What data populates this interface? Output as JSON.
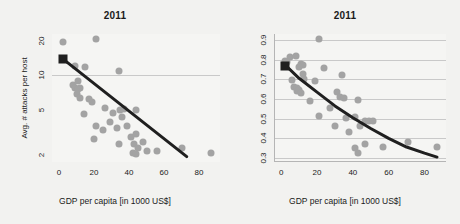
{
  "figure": {
    "background": "#f2f2f0",
    "point_color": "#a3a3a3",
    "fit_color": "#1f1f1f",
    "grid_color": "#c9c9c9"
  },
  "chart_data": [
    {
      "type": "scatter",
      "panel": "left",
      "title": "2011",
      "xlabel": "GDP per capita [in 1000 US$]",
      "ylabel": "Avg. # attacks per host",
      "xlim": [
        -4,
        92
      ],
      "ylim": [
        1.75,
        23
      ],
      "yscale": "log",
      "xticks": [
        0,
        20,
        40,
        60,
        80
      ],
      "xticklabels": [
        "0",
        "20",
        "40",
        "60",
        "80"
      ],
      "yticks": [
        2,
        5,
        10,
        20
      ],
      "yticklabels": [
        "2",
        "5",
        "10",
        "20"
      ],
      "grid": "horizontal-at-10",
      "gridlines_y": [
        10
      ],
      "legend": "none",
      "fit": {
        "kind": "line",
        "marker": {
          "x": 2,
          "y": 14.0,
          "shape": "square",
          "color": "#1f1f1f"
        },
        "points": [
          [
            2,
            14.0
          ],
          [
            73,
            1.95
          ]
        ]
      },
      "points": [
        [
          2,
          19.5
        ],
        [
          21,
          21.0
        ],
        [
          9,
          12.0
        ],
        [
          2,
          14.0
        ],
        [
          15,
          11.8
        ],
        [
          34,
          11.0
        ],
        [
          8,
          8.3
        ],
        [
          9,
          7.7
        ],
        [
          12,
          7.8
        ],
        [
          11,
          7.6
        ],
        [
          10,
          6.9
        ],
        [
          12,
          6.3
        ],
        [
          19,
          5.9
        ],
        [
          14,
          4.6
        ],
        [
          26,
          5.2
        ],
        [
          35,
          5.0
        ],
        [
          37,
          5.1
        ],
        [
          44,
          5.0
        ],
        [
          21,
          3.6
        ],
        [
          29,
          3.9
        ],
        [
          25,
          3.3
        ],
        [
          33,
          3.5
        ],
        [
          39,
          3.6
        ],
        [
          36,
          4.3
        ],
        [
          20,
          2.8
        ],
        [
          34,
          2.5
        ],
        [
          41,
          2.9
        ],
        [
          43,
          2.5
        ],
        [
          44,
          3.1
        ],
        [
          45,
          2.3
        ],
        [
          42,
          2.1
        ],
        [
          48,
          2.6
        ],
        [
          50,
          2.2
        ],
        [
          56,
          2.2
        ],
        [
          70,
          2.3
        ],
        [
          87,
          2.1
        ],
        [
          44,
          2.05
        ],
        [
          31,
          4.7
        ],
        [
          17,
          6.2
        ],
        [
          11,
          9.0
        ]
      ]
    },
    {
      "type": "scatter",
      "panel": "right",
      "title": "2011",
      "xlabel": "GDP per capita [in 1000 US$]",
      "ylabel": "% attacked hosts",
      "xlim": [
        -4,
        92
      ],
      "ylim": [
        0.28,
        0.93
      ],
      "yscale": "linear",
      "xticks": [
        0,
        20,
        40,
        60,
        80
      ],
      "xticklabels": [
        "0",
        "20",
        "40",
        "60",
        "80"
      ],
      "yticks": [
        0.3,
        0.4,
        0.5,
        0.6,
        0.7,
        0.8,
        0.9
      ],
      "yticklabels": [
        "0.3",
        "0.4",
        "0.5",
        "0.6",
        "0.7",
        "0.8",
        "0.9"
      ],
      "grid": "horizontal",
      "gridlines_y": [
        0.3,
        0.4,
        0.5,
        0.6,
        0.7,
        0.8,
        0.9
      ],
      "legend": "none",
      "fit": {
        "kind": "curve",
        "marker": {
          "x": 2,
          "y": 0.77,
          "shape": "square",
          "color": "#1f1f1f"
        },
        "points": [
          [
            2,
            0.775
          ],
          [
            10,
            0.705
          ],
          [
            20,
            0.635
          ],
          [
            30,
            0.565
          ],
          [
            40,
            0.505
          ],
          [
            50,
            0.45
          ],
          [
            60,
            0.4
          ],
          [
            70,
            0.356
          ],
          [
            80,
            0.325
          ],
          [
            87,
            0.305
          ]
        ]
      },
      "points": [
        [
          21,
          0.905
        ],
        [
          5,
          0.815
        ],
        [
          8,
          0.82
        ],
        [
          2,
          0.795
        ],
        [
          3,
          0.79
        ],
        [
          2,
          0.775
        ],
        [
          11,
          0.78
        ],
        [
          12,
          0.775
        ],
        [
          10,
          0.76
        ],
        [
          24,
          0.755
        ],
        [
          6,
          0.695
        ],
        [
          12,
          0.725
        ],
        [
          13,
          0.7
        ],
        [
          19,
          0.69
        ],
        [
          34,
          0.72
        ],
        [
          7,
          0.66
        ],
        [
          9,
          0.655
        ],
        [
          9,
          0.64
        ],
        [
          10,
          0.645
        ],
        [
          11,
          0.63
        ],
        [
          16,
          0.59
        ],
        [
          31,
          0.635
        ],
        [
          33,
          0.61
        ],
        [
          35,
          0.605
        ],
        [
          43,
          0.595
        ],
        [
          27,
          0.555
        ],
        [
          21,
          0.515
        ],
        [
          36,
          0.505
        ],
        [
          41,
          0.51
        ],
        [
          47,
          0.49
        ],
        [
          49,
          0.49
        ],
        [
          51,
          0.49
        ],
        [
          30,
          0.465
        ],
        [
          38,
          0.43
        ],
        [
          44,
          0.465
        ],
        [
          43,
          0.325
        ],
        [
          41,
          0.35
        ],
        [
          47,
          0.37
        ],
        [
          57,
          0.355
        ],
        [
          71,
          0.38
        ],
        [
          87,
          0.355
        ]
      ]
    }
  ]
}
